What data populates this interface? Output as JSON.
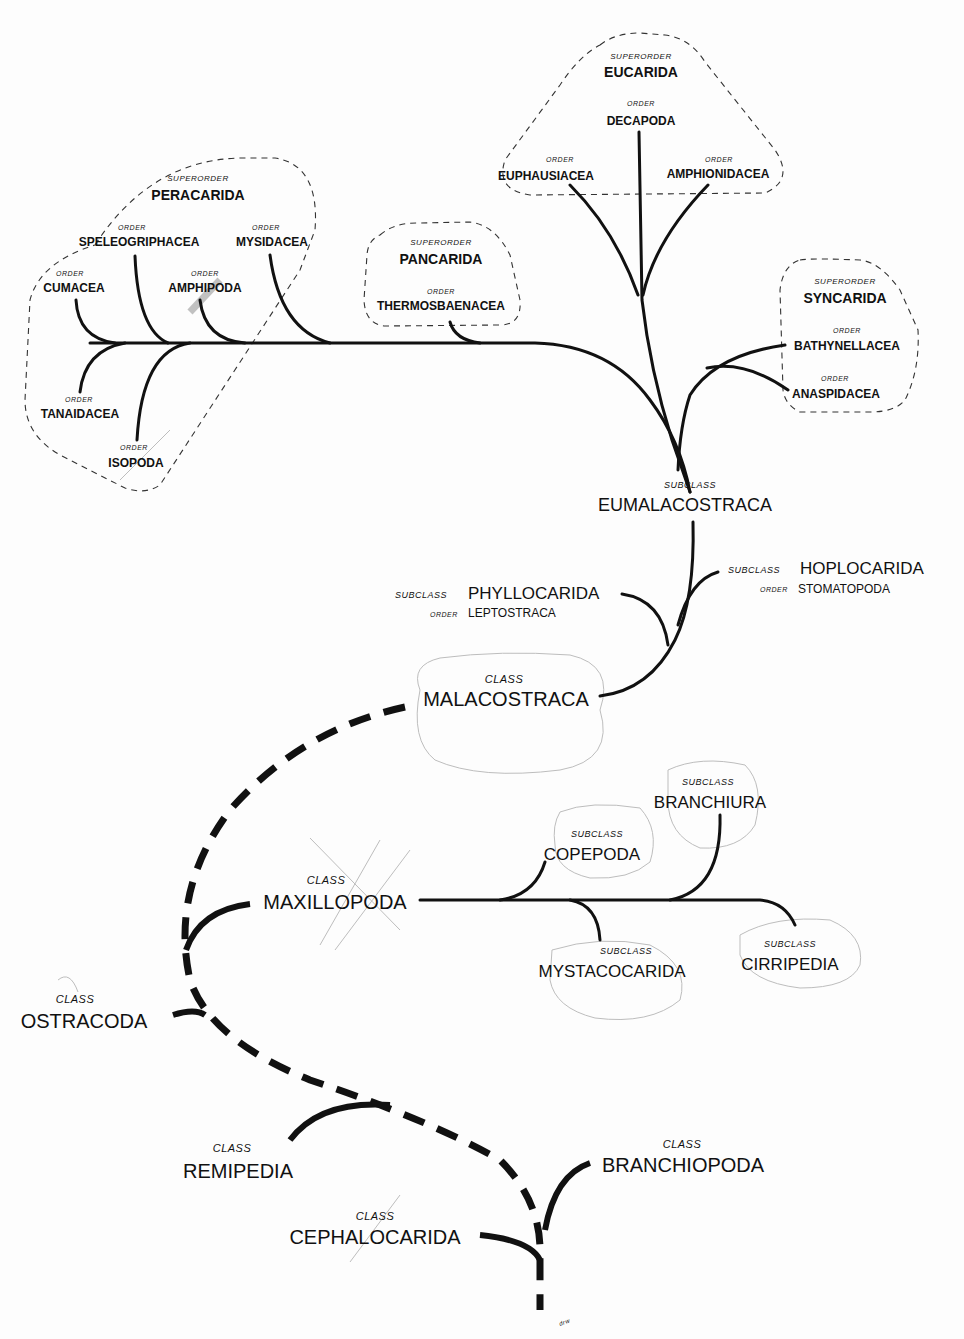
{
  "diagram": {
    "groups": [
      {
        "id": "peracarida",
        "rank": "SUPERORDER",
        "name": "PERACARIDA",
        "x": 198,
        "y": 200
      },
      {
        "id": "pancarida",
        "rank": "SUPERORDER",
        "name": "PANCARIDA",
        "x": 441,
        "y": 264
      },
      {
        "id": "eucarida",
        "rank": "SUPERORDER",
        "name": "EUCARIDA",
        "x": 641,
        "y": 76
      },
      {
        "id": "syncarida",
        "rank": "SUPERORDER",
        "name": "SYNCARIDA",
        "x": 845,
        "y": 302
      }
    ],
    "orders": [
      {
        "id": "speleogriphacea",
        "rank": "ORDER",
        "name": "SPELEOGRIPHACEA",
        "x": 139,
        "y": 246,
        "group": "peracarida"
      },
      {
        "id": "mysidacea",
        "rank": "ORDER",
        "name": "MYSIDACEA",
        "x": 272,
        "y": 246,
        "group": "peracarida"
      },
      {
        "id": "cumacea",
        "rank": "ORDER",
        "name": "CUMACEA",
        "x": 74,
        "y": 292,
        "group": "peracarida"
      },
      {
        "id": "amphipoda",
        "rank": "ORDER",
        "name": "AMPHIPODA",
        "x": 205,
        "y": 292,
        "group": "peracarida"
      },
      {
        "id": "tanaidacea",
        "rank": "ORDER",
        "name": "TANAIDACEA",
        "x": 80,
        "y": 418,
        "group": "peracarida"
      },
      {
        "id": "isopoda",
        "rank": "ORDER",
        "name": "ISOPODA",
        "x": 136,
        "y": 467,
        "group": "peracarida"
      },
      {
        "id": "thermosbaenacea",
        "rank": "ORDER",
        "name": "THERMOSBAENACEA",
        "x": 441,
        "y": 310,
        "group": "pancarida"
      },
      {
        "id": "decapoda",
        "rank": "ORDER",
        "name": "DECAPODA",
        "x": 641,
        "y": 125,
        "group": "eucarida"
      },
      {
        "id": "euphausiacea",
        "rank": "ORDER",
        "name": "EUPHAUSIACEA",
        "x": 546,
        "y": 180,
        "group": "eucarida"
      },
      {
        "id": "amphionidacea",
        "rank": "ORDER",
        "name": "AMPHIONIDACEA",
        "x": 718,
        "y": 178,
        "group": "eucarida"
      },
      {
        "id": "bathynellacea",
        "rank": "ORDER",
        "name": "BATHYNELLACEA",
        "x": 847,
        "y": 350,
        "group": "syncarida"
      },
      {
        "id": "anaspidacea",
        "rank": "ORDER",
        "name": "ANASPIDACEA",
        "x": 836,
        "y": 398,
        "group": "syncarida"
      }
    ],
    "subclasses": {
      "eumalacostraca": {
        "rank": "SUBCLASS",
        "name": "EUMALACOSTRACA"
      },
      "hoplocarida": {
        "rank": "SUBCLASS",
        "name": "HOPLOCARIDA",
        "order_rank": "ORDER",
        "order": "STOMATOPODA"
      },
      "phyllocarida": {
        "rank": "SUBCLASS",
        "name": "PHYLLOCARIDA",
        "order_rank": "ORDER",
        "order": "LEPTOSTRACA"
      },
      "copepoda": {
        "rank": "SUBCLASS",
        "name": "COPEPODA"
      },
      "branchiura": {
        "rank": "SUBCLASS",
        "name": "BRANCHIURA"
      },
      "mystacocarida": {
        "rank": "SUBCLASS",
        "name": "MYSTACOCARIDA"
      },
      "cirripedia": {
        "rank": "SUBCLASS",
        "name": "CIRRIPEDIA"
      }
    },
    "classes": {
      "malacostraca": {
        "rank": "CLASS",
        "name": "MALACOSTRACA"
      },
      "maxillopoda": {
        "rank": "CLASS",
        "name": "MAXILLOPODA"
      },
      "ostracoda": {
        "rank": "CLASS",
        "name": "OSTRACODA"
      },
      "remipedia": {
        "rank": "CLASS",
        "name": "REMIPEDIA"
      },
      "branchiopoda": {
        "rank": "CLASS",
        "name": "BRANCHIOPODA"
      },
      "cephalocarida": {
        "rank": "CLASS",
        "name": "CEPHALOCARIDA"
      }
    },
    "signature": "drw",
    "colors": {
      "ink": "#111111",
      "pencil": "#bdbdbd",
      "paper": "#fdfdfd"
    }
  }
}
